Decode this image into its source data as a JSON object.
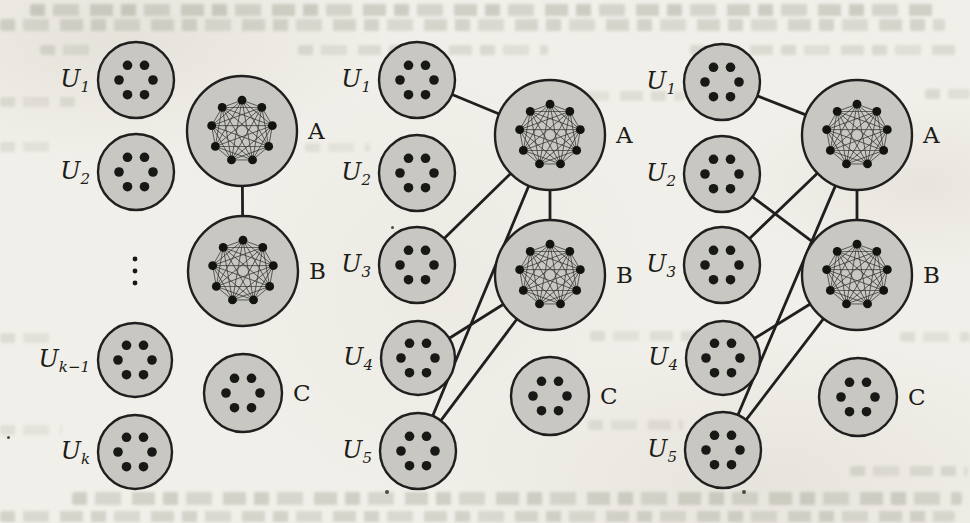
{
  "figure": {
    "colors": {
      "background": "#f1efe9",
      "set_fill": "#c8c7c2",
      "stroke": "#1f1f1f"
    },
    "ellipsis_symbol": "⋮",
    "panels": [
      {
        "id": "left",
        "sets": [
          {
            "id": "U1",
            "label_base": "U",
            "label_sub": "1",
            "label_side": "left",
            "cx": 136,
            "cy": 80,
            "r": 38,
            "contents": "dots"
          },
          {
            "id": "U2",
            "label_base": "U",
            "label_sub": "2",
            "label_side": "left",
            "cx": 136,
            "cy": 172,
            "r": 38,
            "contents": "dots"
          },
          {
            "id": "Uk1",
            "label_base": "U",
            "label_sub": "k−1",
            "label_side": "left",
            "cx": 135,
            "cy": 360,
            "r": 37,
            "contents": "dots"
          },
          {
            "id": "Uk",
            "label_base": "U",
            "label_sub": "k",
            "label_side": "left",
            "cx": 135,
            "cy": 452,
            "r": 37,
            "contents": "dots"
          },
          {
            "id": "A",
            "label": "A",
            "label_side": "right",
            "cx": 242,
            "cy": 131,
            "r": 55,
            "contents": "clique"
          },
          {
            "id": "B",
            "label": "B",
            "label_side": "right",
            "cx": 243,
            "cy": 271,
            "r": 55,
            "contents": "clique"
          },
          {
            "id": "C",
            "label": "C",
            "label_side": "right",
            "cx": 243,
            "cy": 393,
            "r": 39,
            "contents": "dots"
          }
        ],
        "ellipsis": {
          "x": 135,
          "y": 271
        },
        "edges": [
          [
            "A",
            "B"
          ]
        ]
      },
      {
        "id": "middle",
        "sets": [
          {
            "id": "U1",
            "label_base": "U",
            "label_sub": "1",
            "label_side": "left",
            "cx": 417,
            "cy": 80,
            "r": 38,
            "contents": "dots"
          },
          {
            "id": "U2",
            "label_base": "U",
            "label_sub": "2",
            "label_side": "left",
            "cx": 417,
            "cy": 173,
            "r": 38,
            "contents": "dots"
          },
          {
            "id": "U3",
            "label_base": "U",
            "label_sub": "3",
            "label_side": "left",
            "cx": 417,
            "cy": 265,
            "r": 38,
            "contents": "dots"
          },
          {
            "id": "U4",
            "label_base": "U",
            "label_sub": "4",
            "label_side": "left",
            "cx": 418,
            "cy": 358,
            "r": 37,
            "contents": "dots"
          },
          {
            "id": "U5",
            "label_base": "U",
            "label_sub": "5",
            "label_side": "left",
            "cx": 418,
            "cy": 451,
            "r": 38,
            "contents": "dots"
          },
          {
            "id": "A",
            "label": "A",
            "label_side": "right",
            "cx": 550,
            "cy": 135,
            "r": 55,
            "contents": "clique"
          },
          {
            "id": "B",
            "label": "B",
            "label_side": "right",
            "cx": 550,
            "cy": 275,
            "r": 55,
            "contents": "clique"
          },
          {
            "id": "C",
            "label": "C",
            "label_side": "right",
            "cx": 550,
            "cy": 396,
            "r": 39,
            "contents": "dots"
          }
        ],
        "edges": [
          [
            "U1",
            "A"
          ],
          [
            "U3",
            "A"
          ],
          [
            "A",
            "B"
          ],
          [
            "A",
            "U5"
          ],
          [
            "U4",
            "B"
          ],
          [
            "B",
            "U5"
          ]
        ]
      },
      {
        "id": "right",
        "sets": [
          {
            "id": "U1",
            "label_base": "U",
            "label_sub": "1",
            "label_side": "left",
            "cx": 722,
            "cy": 82,
            "r": 38,
            "contents": "dots"
          },
          {
            "id": "U2",
            "label_base": "U",
            "label_sub": "2",
            "label_side": "left",
            "cx": 722,
            "cy": 174,
            "r": 38,
            "contents": "dots"
          },
          {
            "id": "U3",
            "label_base": "U",
            "label_sub": "3",
            "label_side": "left",
            "cx": 722,
            "cy": 265,
            "r": 38,
            "contents": "dots"
          },
          {
            "id": "U4",
            "label_base": "U",
            "label_sub": "4",
            "label_side": "left",
            "cx": 723,
            "cy": 358,
            "r": 37,
            "contents": "dots"
          },
          {
            "id": "U5",
            "label_base": "U",
            "label_sub": "5",
            "label_side": "left",
            "cx": 723,
            "cy": 450,
            "r": 38,
            "contents": "dots"
          },
          {
            "id": "A",
            "label": "A",
            "label_side": "right",
            "cx": 857,
            "cy": 135,
            "r": 55,
            "contents": "clique"
          },
          {
            "id": "B",
            "label": "B",
            "label_side": "right",
            "cx": 857,
            "cy": 275,
            "r": 55,
            "contents": "clique"
          },
          {
            "id": "C",
            "label": "C",
            "label_side": "right",
            "cx": 858,
            "cy": 397,
            "r": 39,
            "contents": "dots"
          }
        ],
        "edges": [
          [
            "U1",
            "A"
          ],
          [
            "U2",
            "B"
          ],
          [
            "U3",
            "A"
          ],
          [
            "A",
            "B"
          ],
          [
            "A",
            "U5"
          ],
          [
            "U4",
            "B"
          ],
          [
            "B",
            "U5"
          ]
        ]
      }
    ]
  }
}
